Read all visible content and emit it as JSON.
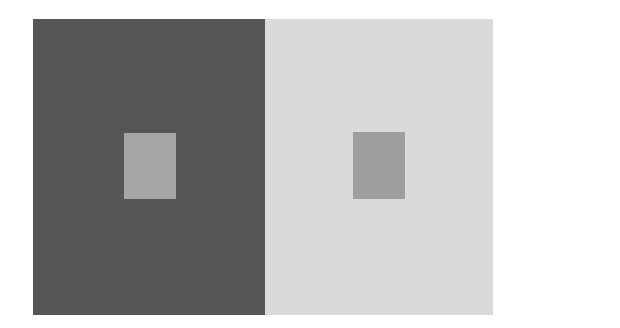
{
  "figure": {
    "type": "simultaneous-contrast-illusion",
    "background_color": "#ffffff",
    "panels": [
      {
        "name": "dark-panel",
        "color": "#565656",
        "x": 33,
        "y": 19,
        "width": 232,
        "height": 296,
        "inner_square": {
          "color": "#a6a6a6",
          "x": 124,
          "y": 133,
          "width": 52,
          "height": 66
        }
      },
      {
        "name": "light-panel",
        "color": "#dadada",
        "x": 265,
        "y": 19,
        "width": 228,
        "height": 296,
        "inner_square": {
          "color": "#9e9e9e",
          "x": 353,
          "y": 132,
          "width": 52,
          "height": 67
        }
      }
    ]
  }
}
